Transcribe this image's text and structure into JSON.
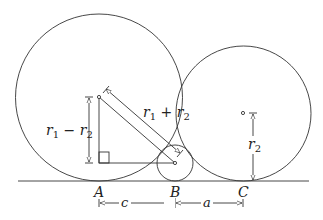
{
  "points": {
    "A": "A",
    "B": "B",
    "C": "C"
  },
  "labels": {
    "r1_minus_r2": {
      "r": "r",
      "s1": "1",
      "op": " − ",
      "r_b": "r",
      "s2": "2"
    },
    "r1_plus_r2": {
      "r": "r",
      "s1": "1",
      "op": " + ",
      "r_b": "r",
      "s2": "2"
    },
    "r2": {
      "r": "r",
      "s": "2"
    },
    "c": "c",
    "a": "a"
  },
  "geometry": {
    "ground_y": 181,
    "big_circle": {
      "cx": 99,
      "cy": 97.5,
      "r": 83.5
    },
    "right_circle": {
      "cx": 243.5,
      "cy": 113.5,
      "r": 67.5
    },
    "small_circle": {
      "cx": 175,
      "cy": 163,
      "r": 18
    }
  },
  "colors": {
    "stroke": "#333333"
  }
}
